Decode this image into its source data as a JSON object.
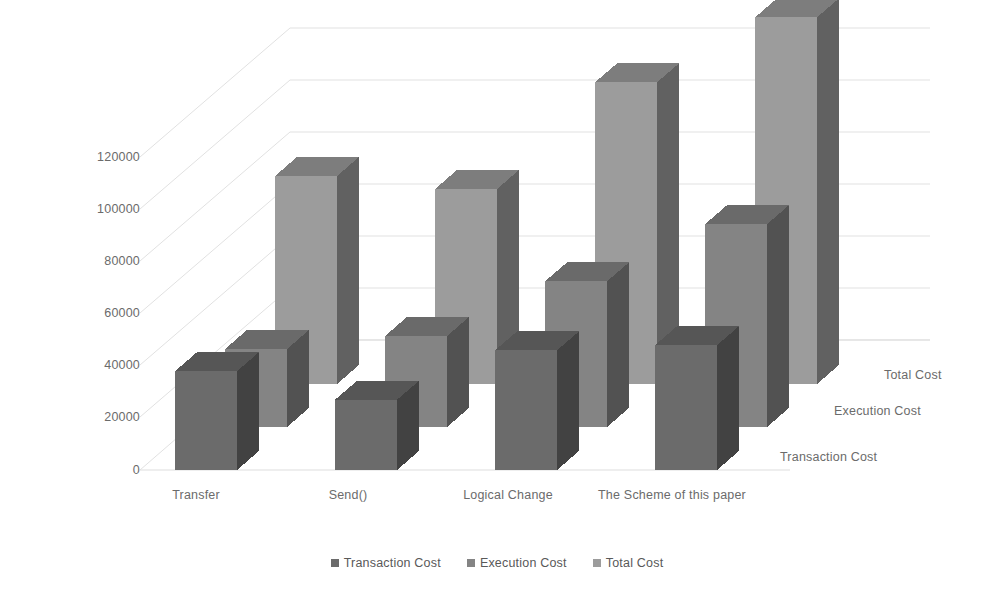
{
  "chart_data": {
    "type": "bar",
    "variant": "3d-clustered-column",
    "title": "",
    "subtitle": "",
    "xlabel": "",
    "ylabel": "",
    "zlabel": "",
    "categories": [
      "Transfer",
      "Send()",
      "Logical Change",
      "The Scheme of this paper"
    ],
    "series": [
      {
        "name": "Transaction Cost",
        "values": [
          38000,
          27000,
          46000,
          48000
        ],
        "color": "#6b6b6b"
      },
      {
        "name": "Execution Cost",
        "values": [
          30000,
          35000,
          56000,
          78000
        ],
        "color": "#848484"
      },
      {
        "name": "Total Cost",
        "values": [
          80000,
          75000,
          116000,
          141000
        ],
        "color": "#9c9c9c"
      }
    ],
    "yticks": [
      0,
      20000,
      40000,
      60000,
      80000,
      100000,
      120000
    ],
    "ytick_labels": [
      "0",
      "20000",
      "40000",
      "60000",
      "80000",
      "100000",
      "120000"
    ],
    "ylim": [
      0,
      140000
    ],
    "grid": true,
    "grid_color": "#e3e3e3",
    "legend_position": "bottom",
    "background": "#ffffff"
  },
  "axes": {
    "y_tick_labels": [
      "120000",
      "100000",
      "80000",
      "60000",
      "40000",
      "20000",
      "0"
    ],
    "x_tick_labels": [
      "Transfer",
      "Send()",
      "Logical Change",
      "The Scheme of this paper"
    ],
    "z_tick_labels": [
      "Total Cost",
      "Execution Cost",
      "Transaction Cost"
    ]
  },
  "legend": {
    "items": [
      {
        "label": "Transaction Cost",
        "color": "#6b6b6b"
      },
      {
        "label": "Execution Cost",
        "color": "#848484"
      },
      {
        "label": "Total Cost",
        "color": "#9c9c9c"
      }
    ]
  }
}
